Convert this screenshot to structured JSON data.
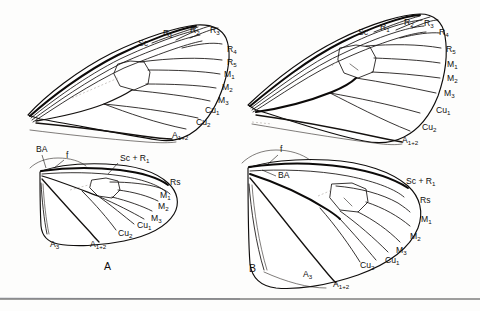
{
  "figure": {
    "type": "scientific-illustration",
    "background_color": "#fdfdfc",
    "ink_color": "#14110f",
    "panel_labels": [
      {
        "id": "A",
        "text": "A"
      },
      {
        "id": "B",
        "text": "B"
      }
    ],
    "footer_rule": true
  },
  "wings": [
    {
      "id": "a-forewing",
      "panel": "A",
      "kind": "forewing",
      "position": "top-left",
      "labels": [
        {
          "key": "sc",
          "text": "Sc",
          "base": "Sc",
          "sub": "",
          "x": 138,
          "y": 46
        },
        {
          "key": "r1",
          "text": "R1",
          "base": "R",
          "sub": "1",
          "x": 163,
          "y": 36
        },
        {
          "key": "r2",
          "text": "R2",
          "base": "R",
          "sub": "2",
          "x": 190,
          "y": 33
        },
        {
          "key": "r3",
          "text": "R3",
          "base": "R",
          "sub": "3",
          "x": 210,
          "y": 33
        },
        {
          "key": "r4",
          "text": "R4",
          "base": "R",
          "sub": "4",
          "x": 227,
          "y": 52
        },
        {
          "key": "r5",
          "text": "R5",
          "base": "R",
          "sub": "5",
          "x": 227,
          "y": 65
        },
        {
          "key": "m1",
          "text": "M1",
          "base": "M",
          "sub": "1",
          "x": 224,
          "y": 77
        },
        {
          "key": "m2",
          "text": "M2",
          "base": "M",
          "sub": "2",
          "x": 222,
          "y": 90
        },
        {
          "key": "m3",
          "text": "M3",
          "base": "M",
          "sub": "3",
          "x": 218,
          "y": 103
        },
        {
          "key": "cu1",
          "text": "Cu1",
          "base": "Cu",
          "sub": "1",
          "x": 205,
          "y": 113
        },
        {
          "key": "cu2",
          "text": "Cu2",
          "base": "Cu",
          "sub": "2",
          "x": 196,
          "y": 125
        },
        {
          "key": "a12",
          "text": "A1+2",
          "base": "A",
          "sub": "1+2",
          "x": 172,
          "y": 138
        }
      ]
    },
    {
      "id": "a-hindwing",
      "panel": "A",
      "kind": "hindwing",
      "position": "bottom-left",
      "labels": [
        {
          "key": "ba",
          "text": "BA",
          "base": "BA",
          "sub": "",
          "x": 36,
          "y": 152
        },
        {
          "key": "f",
          "text": "f",
          "base": "f",
          "sub": "",
          "x": 66,
          "y": 158
        },
        {
          "key": "scr1",
          "text": "Sc + R1",
          "base": "Sc + R",
          "sub": "1",
          "x": 120,
          "y": 161
        },
        {
          "key": "rs",
          "text": "Rs",
          "base": "Rs",
          "sub": "",
          "x": 170,
          "y": 185
        },
        {
          "key": "m1",
          "text": "M1",
          "base": "M",
          "sub": "1",
          "x": 160,
          "y": 198
        },
        {
          "key": "m2",
          "text": "M2",
          "base": "M",
          "sub": "2",
          "x": 158,
          "y": 209
        },
        {
          "key": "m3",
          "text": "M3",
          "base": "M",
          "sub": "3",
          "x": 151,
          "y": 221
        },
        {
          "key": "cu1",
          "text": "Cu1",
          "base": "Cu",
          "sub": "1",
          "x": 137,
          "y": 228
        },
        {
          "key": "cu2",
          "text": "Cu2",
          "base": "Cu",
          "sub": "2",
          "x": 118,
          "y": 236
        },
        {
          "key": "a3",
          "text": "A3",
          "base": "A",
          "sub": "3",
          "x": 50,
          "y": 247
        },
        {
          "key": "a12",
          "text": "A1+2",
          "base": "A",
          "sub": "1+2",
          "x": 90,
          "y": 247
        }
      ]
    },
    {
      "id": "b-forewing",
      "panel": "B",
      "kind": "forewing",
      "position": "top-right",
      "labels": [
        {
          "key": "sc",
          "text": "Sc",
          "base": "Sc",
          "sub": "",
          "x": 358,
          "y": 35
        },
        {
          "key": "r1",
          "text": "R1",
          "base": "R",
          "sub": "1",
          "x": 380,
          "y": 30
        },
        {
          "key": "r2",
          "text": "R2",
          "base": "R",
          "sub": "2",
          "x": 404,
          "y": 25
        },
        {
          "key": "r3",
          "text": "R3",
          "base": "R",
          "sub": "3",
          "x": 424,
          "y": 26
        },
        {
          "key": "r4",
          "text": "R4",
          "base": "R",
          "sub": "4",
          "x": 439,
          "y": 35
        },
        {
          "key": "r5",
          "text": "R5",
          "base": "R",
          "sub": "5",
          "x": 446,
          "y": 52
        },
        {
          "key": "m1",
          "text": "M1",
          "base": "M",
          "sub": "1",
          "x": 447,
          "y": 67
        },
        {
          "key": "m2",
          "text": "M2",
          "base": "M",
          "sub": "2",
          "x": 447,
          "y": 81
        },
        {
          "key": "m3",
          "text": "M3",
          "base": "M",
          "sub": "3",
          "x": 444,
          "y": 96
        },
        {
          "key": "cu1",
          "text": "Cu1",
          "base": "Cu",
          "sub": "1",
          "x": 436,
          "y": 113
        },
        {
          "key": "cu2",
          "text": "Cu2",
          "base": "Cu",
          "sub": "2",
          "x": 422,
          "y": 130
        },
        {
          "key": "a12",
          "text": "A1+2",
          "base": "A",
          "sub": "1+2",
          "x": 402,
          "y": 143
        }
      ]
    },
    {
      "id": "b-hindwing",
      "panel": "B",
      "kind": "hindwing",
      "position": "bottom-right",
      "labels": [
        {
          "key": "f",
          "text": "f",
          "base": "f",
          "sub": "",
          "x": 280,
          "y": 152
        },
        {
          "key": "ba",
          "text": "BA",
          "base": "BA",
          "sub": "",
          "x": 278,
          "y": 178
        },
        {
          "key": "scr1",
          "text": "Sc + R1",
          "base": "Sc + R",
          "sub": "1",
          "x": 406,
          "y": 184
        },
        {
          "key": "rs",
          "text": "Rs",
          "base": "Rs",
          "sub": "",
          "x": 420,
          "y": 203
        },
        {
          "key": "m1",
          "text": "M1",
          "base": "M",
          "sub": "1",
          "x": 421,
          "y": 222
        },
        {
          "key": "m2",
          "text": "M2",
          "base": "M",
          "sub": "2",
          "x": 410,
          "y": 239
        },
        {
          "key": "m3",
          "text": "M3",
          "base": "M",
          "sub": "3",
          "x": 396,
          "y": 253
        },
        {
          "key": "cu1",
          "text": "Cu1",
          "base": "Cu",
          "sub": "1",
          "x": 385,
          "y": 263
        },
        {
          "key": "cu2",
          "text": "Cu2",
          "base": "Cu",
          "sub": "2",
          "x": 360,
          "y": 268
        },
        {
          "key": "a3",
          "text": "A3",
          "base": "A",
          "sub": "3",
          "x": 303,
          "y": 277
        },
        {
          "key": "a12",
          "text": "A1+2",
          "base": "A",
          "sub": "1+2",
          "x": 333,
          "y": 287
        }
      ]
    }
  ]
}
